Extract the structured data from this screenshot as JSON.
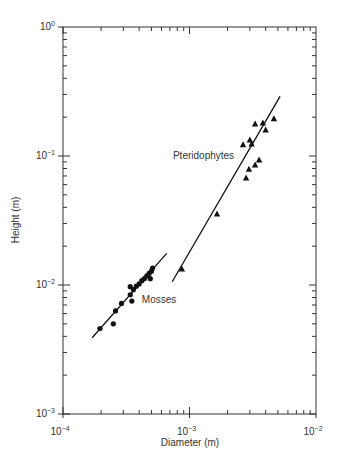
{
  "chart_data": {
    "type": "scatter",
    "scale": "log-log",
    "title": "",
    "xlabel": "Diameter (m)",
    "ylabel": "Height (m)",
    "xlim": [
      0.0001,
      0.01
    ],
    "ylim": [
      0.001,
      1
    ],
    "x_ticks": [
      {
        "base": "10",
        "exp": "-4",
        "value": 0.0001
      },
      {
        "base": "10",
        "exp": "-3",
        "value": 0.001
      },
      {
        "base": "10",
        "exp": "-2",
        "value": 0.01
      }
    ],
    "y_ticks": [
      {
        "base": "10",
        "exp": "-3",
        "value": 0.001
      },
      {
        "base": "10",
        "exp": "-2",
        "value": 0.01
      },
      {
        "base": "10",
        "exp": "-1",
        "value": 0.1
      },
      {
        "base": "10",
        "exp": "0",
        "value": 1
      }
    ],
    "grid": false,
    "legend": "none (inline labels)",
    "series": [
      {
        "name": "Mosses",
        "marker": "circle",
        "label_pos": {
          "x": 0.00042,
          "y": 0.0073
        },
        "points": [
          {
            "x": 0.000196,
            "y": 0.0046
          },
          {
            "x": 0.00025,
            "y": 0.005
          },
          {
            "x": 0.00026,
            "y": 0.0063
          },
          {
            "x": 0.00029,
            "y": 0.0072
          },
          {
            "x": 0.00034,
            "y": 0.0084
          },
          {
            "x": 0.00035,
            "y": 0.0075
          },
          {
            "x": 0.00034,
            "y": 0.0097
          },
          {
            "x": 0.00036,
            "y": 0.0092
          },
          {
            "x": 0.00038,
            "y": 0.0098
          },
          {
            "x": 0.0004,
            "y": 0.0102
          },
          {
            "x": 0.00042,
            "y": 0.0108
          },
          {
            "x": 0.00044,
            "y": 0.0112
          },
          {
            "x": 0.00046,
            "y": 0.0118
          },
          {
            "x": 0.00048,
            "y": 0.0123
          },
          {
            "x": 0.0005,
            "y": 0.0128
          },
          {
            "x": 0.00049,
            "y": 0.0112
          },
          {
            "x": 0.00051,
            "y": 0.0135
          }
        ],
        "fit_line": {
          "x": [
            0.00017,
            0.00066
          ],
          "y": [
            0.0039,
            0.0176
          ]
        }
      },
      {
        "name": "Pteridophytes",
        "marker": "triangle",
        "label_pos": {
          "x": 0.00074,
          "y": 0.095
        },
        "points": [
          {
            "x": 0.00087,
            "y": 0.0133
          },
          {
            "x": 0.00165,
            "y": 0.0355
          },
          {
            "x": 0.0028,
            "y": 0.0675
          },
          {
            "x": 0.00295,
            "y": 0.079
          },
          {
            "x": 0.0033,
            "y": 0.085
          },
          {
            "x": 0.00355,
            "y": 0.093
          },
          {
            "x": 0.00265,
            "y": 0.122
          },
          {
            "x": 0.003,
            "y": 0.133
          },
          {
            "x": 0.0031,
            "y": 0.124
          },
          {
            "x": 0.004,
            "y": 0.159
          },
          {
            "x": 0.0033,
            "y": 0.177
          },
          {
            "x": 0.0038,
            "y": 0.18
          },
          {
            "x": 0.00465,
            "y": 0.194
          }
        ],
        "fit_line": {
          "x": [
            0.00073,
            0.0052
          ],
          "y": [
            0.0106,
            0.29
          ]
        }
      }
    ]
  }
}
